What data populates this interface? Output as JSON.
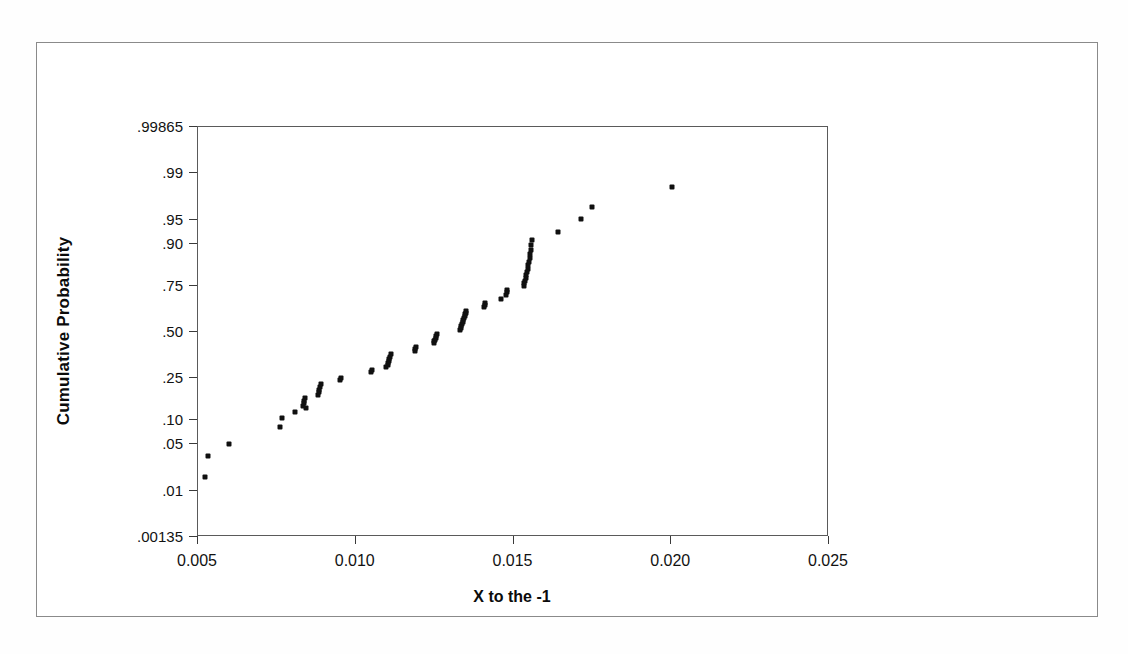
{
  "chart_data": {
    "type": "scatter",
    "title": "",
    "subtitle": "",
    "xlabel": "X to the -1",
    "ylabel": "Cumulative Probability",
    "xlim": [
      0.005,
      0.025
    ],
    "ylim": [
      0.00135,
      0.99865
    ],
    "x_ticks": [
      "0.005",
      "0.010",
      "0.015",
      "0.020",
      "0.025"
    ],
    "x_tick_values": [
      0.005,
      0.01,
      0.015,
      0.02,
      0.025
    ],
    "y_ticks": [
      ".99865",
      ".99",
      ".95",
      ".90",
      ".75",
      ".50",
      ".25",
      ".10",
      ".05",
      ".01",
      ".00135"
    ],
    "y_tick_values": [
      0.99865,
      0.99,
      0.95,
      0.9,
      0.75,
      0.5,
      0.25,
      0.1,
      0.05,
      0.01,
      0.00135
    ],
    "y_scale": "normal-probability",
    "grid": false,
    "legend": null,
    "marker": {
      "shape": "square",
      "color": "#101010",
      "size": 5
    },
    "points": [
      {
        "x": 0.00524,
        "y": 0.0165
      },
      {
        "x": 0.00536,
        "y": 0.0335
      },
      {
        "x": 0.00601,
        "y": 0.0495
      },
      {
        "x": 0.00762,
        "y": 0.0795
      },
      {
        "x": 0.00768,
        "y": 0.1005
      },
      {
        "x": 0.00812,
        "y": 0.1185
      },
      {
        "x": 0.00836,
        "y": 0.1355
      },
      {
        "x": 0.00838,
        "y": 0.1455
      },
      {
        "x": 0.0084,
        "y": 0.1545
      },
      {
        "x": 0.00842,
        "y": 0.1635
      },
      {
        "x": 0.00845,
        "y": 0.1295
      },
      {
        "x": 0.00884,
        "y": 0.1735
      },
      {
        "x": 0.00886,
        "y": 0.1855
      },
      {
        "x": 0.00888,
        "y": 0.1955
      },
      {
        "x": 0.0089,
        "y": 0.2065
      },
      {
        "x": 0.00892,
        "y": 0.2175
      },
      {
        "x": 0.00952,
        "y": 0.2355
      },
      {
        "x": 0.00955,
        "y": 0.2455
      },
      {
        "x": 0.01052,
        "y": 0.2745
      },
      {
        "x": 0.01055,
        "y": 0.2855
      },
      {
        "x": 0.011,
        "y": 0.2985
      },
      {
        "x": 0.01104,
        "y": 0.3105
      },
      {
        "x": 0.01106,
        "y": 0.3215
      },
      {
        "x": 0.01108,
        "y": 0.3325
      },
      {
        "x": 0.0111,
        "y": 0.3435
      },
      {
        "x": 0.01112,
        "y": 0.3545
      },
      {
        "x": 0.01114,
        "y": 0.3655
      },
      {
        "x": 0.0119,
        "y": 0.3865
      },
      {
        "x": 0.01192,
        "y": 0.3975
      },
      {
        "x": 0.01194,
        "y": 0.4085
      },
      {
        "x": 0.0125,
        "y": 0.4285
      },
      {
        "x": 0.01252,
        "y": 0.4395
      },
      {
        "x": 0.01254,
        "y": 0.4505
      },
      {
        "x": 0.01256,
        "y": 0.4615
      },
      {
        "x": 0.01258,
        "y": 0.4725
      },
      {
        "x": 0.0126,
        "y": 0.4835
      },
      {
        "x": 0.01334,
        "y": 0.5065
      },
      {
        "x": 0.01336,
        "y": 0.5185
      },
      {
        "x": 0.01338,
        "y": 0.5295
      },
      {
        "x": 0.0134,
        "y": 0.5405
      },
      {
        "x": 0.01342,
        "y": 0.5515
      },
      {
        "x": 0.01344,
        "y": 0.5625
      },
      {
        "x": 0.01346,
        "y": 0.5735
      },
      {
        "x": 0.01348,
        "y": 0.5845
      },
      {
        "x": 0.0135,
        "y": 0.5955
      },
      {
        "x": 0.01352,
        "y": 0.6065
      },
      {
        "x": 0.01354,
        "y": 0.6175
      },
      {
        "x": 0.0141,
        "y": 0.6385
      },
      {
        "x": 0.01412,
        "y": 0.6495
      },
      {
        "x": 0.01414,
        "y": 0.6605
      },
      {
        "x": 0.01462,
        "y": 0.6805
      },
      {
        "x": 0.0148,
        "y": 0.7005
      },
      {
        "x": 0.01482,
        "y": 0.7155
      },
      {
        "x": 0.01484,
        "y": 0.7265
      },
      {
        "x": 0.01536,
        "y": 0.7455
      },
      {
        "x": 0.01538,
        "y": 0.7575
      },
      {
        "x": 0.0154,
        "y": 0.7695
      },
      {
        "x": 0.01542,
        "y": 0.7815
      },
      {
        "x": 0.01544,
        "y": 0.7935
      },
      {
        "x": 0.01546,
        "y": 0.8055
      },
      {
        "x": 0.01548,
        "y": 0.8185
      },
      {
        "x": 0.0155,
        "y": 0.8315
      },
      {
        "x": 0.01552,
        "y": 0.8445
      },
      {
        "x": 0.01554,
        "y": 0.8575
      },
      {
        "x": 0.01556,
        "y": 0.8705
      },
      {
        "x": 0.01558,
        "y": 0.8835
      },
      {
        "x": 0.0156,
        "y": 0.8965
      },
      {
        "x": 0.01562,
        "y": 0.9095
      },
      {
        "x": 0.01645,
        "y": 0.9265
      },
      {
        "x": 0.01716,
        "y": 0.9495
      },
      {
        "x": 0.01752,
        "y": 0.9655
      },
      {
        "x": 0.02005,
        "y": 0.9825
      }
    ]
  },
  "axes": {
    "ylabel": "Cumulative Probability",
    "xlabel": "X to the -1"
  }
}
